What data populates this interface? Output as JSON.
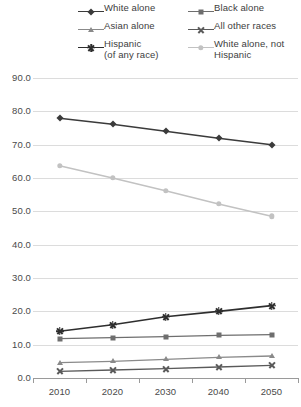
{
  "legend": {
    "entries": [
      {
        "label": "White alone",
        "marker": "diamond",
        "color": "#3b3b3b",
        "col": 0,
        "row": 0
      },
      {
        "label": "Black alone",
        "marker": "square",
        "color": "#6e6e6e",
        "col": 1,
        "row": 0
      },
      {
        "label": "Asian alone",
        "marker": "triangle",
        "color": "#8a8a8a",
        "col": 0,
        "row": 1
      },
      {
        "label": "All other races",
        "marker": "x",
        "color": "#5a5a5a",
        "col": 1,
        "row": 1
      },
      {
        "label": "Hispanic\n(of any race)",
        "marker": "star",
        "color": "#2e2e2e",
        "col": 0,
        "row": 2
      },
      {
        "label": "White alone, not\nHispanic",
        "marker": "circle",
        "color": "#c2c2c2",
        "col": 1,
        "row": 2
      }
    ]
  },
  "chart_data": {
    "type": "line",
    "title": "",
    "subtitle": "",
    "xlabel": "",
    "ylabel": "",
    "categories": [
      "2010",
      "2020",
      "2030",
      "2040",
      "2050"
    ],
    "ylim": [
      0.0,
      90.0
    ],
    "ytick_step": 10.0,
    "ytick_labels": [
      "0.0",
      "10.0",
      "20.0",
      "30.0",
      "40.0",
      "50.0",
      "60.0",
      "70.0",
      "80.0",
      "90.0"
    ],
    "grid": true,
    "legend_position": "top",
    "series": [
      {
        "name": "White alone",
        "marker": "diamond",
        "color": "#3b3b3b",
        "width": 1.6,
        "values": [
          77.9,
          76.1,
          74.0,
          71.9,
          70.0
        ]
      },
      {
        "name": "White alone, not Hispanic",
        "marker": "circle",
        "color": "#c2c2c2",
        "width": 1.5,
        "values": [
          63.7,
          60.0,
          56.2,
          52.2,
          48.5
        ]
      },
      {
        "name": "Hispanic (of any race)",
        "marker": "star",
        "color": "#2e2e2e",
        "width": 1.6,
        "values": [
          14.0,
          16.0,
          18.4,
          20.0,
          21.7
        ]
      },
      {
        "name": "Black alone",
        "marker": "square",
        "color": "#6e6e6e",
        "width": 1.4,
        "values": [
          11.8,
          12.1,
          12.4,
          12.8,
          13.0
        ]
      },
      {
        "name": "Asian alone",
        "marker": "triangle",
        "color": "#8a8a8a",
        "width": 1.3,
        "values": [
          4.6,
          5.0,
          5.6,
          6.2,
          6.6
        ]
      },
      {
        "name": "All other races",
        "marker": "x",
        "color": "#5a5a5a",
        "width": 1.3,
        "values": [
          2.0,
          2.4,
          2.8,
          3.3,
          3.8
        ]
      }
    ]
  }
}
